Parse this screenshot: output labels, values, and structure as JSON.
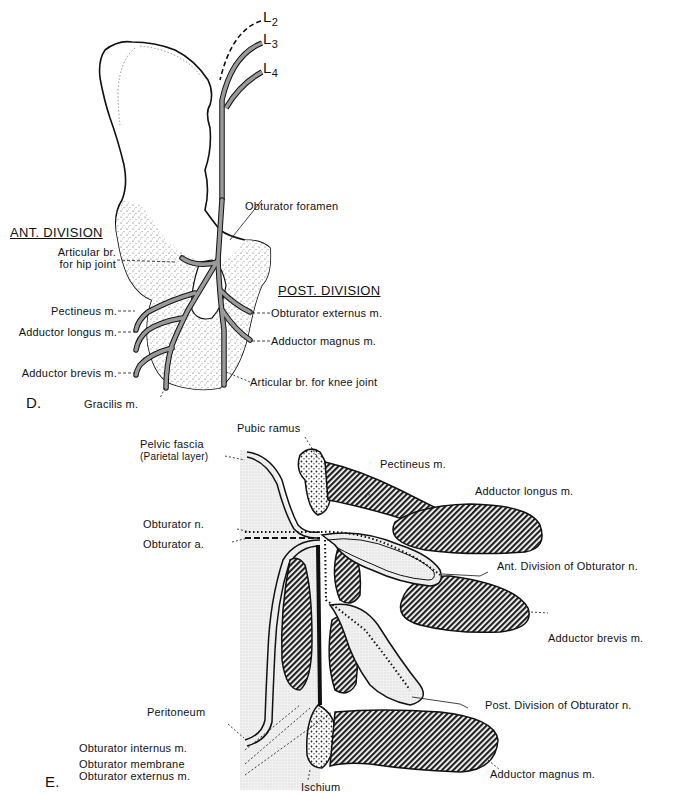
{
  "figure_d": {
    "panel_label": "D.",
    "roots": [
      "L2",
      "L3",
      "L4"
    ],
    "roots_display": {
      "l2": "L",
      "l2_sub": "2",
      "l3": "L",
      "l3_sub": "3",
      "l4": "L",
      "l4_sub": "4"
    },
    "obturator_foramen": "Obturator foramen",
    "ant_division": {
      "heading": "ANT. DIVISION",
      "branches": [
        {
          "line1": "Articular br.",
          "line2": "for hip joint"
        },
        {
          "label": "Pectineus m."
        },
        {
          "label": "Adductor longus m."
        },
        {
          "label": "Adductor brevis m."
        },
        {
          "label": "Gracilis m."
        }
      ]
    },
    "post_division": {
      "heading": "POST. DIVISION",
      "branches": [
        {
          "label": "Obturator externus m."
        },
        {
          "label": "Adductor magnus m."
        },
        {
          "label": "Articular br. for knee joint"
        }
      ]
    }
  },
  "figure_e": {
    "panel_label": "E.",
    "labels": {
      "pubic_ramus": "Pubic ramus",
      "pelvic_fascia_1": "Pelvic fascia",
      "pelvic_fascia_2": "(Parietal layer)",
      "pectineus": "Pectineus m.",
      "adductor_longus": "Adductor longus m.",
      "obturator_n": "Obturator n.",
      "obturator_a": "Obturator a.",
      "ant_division": "Ant. Division of Obturator n.",
      "adductor_brevis": "Adductor brevis m.",
      "peritoneum": "Peritoneum",
      "post_division": "Post. Division of Obturator n.",
      "obturator_internus": "Obturator internus m.",
      "obturator_membrane": "Obturator membrane",
      "obturator_externus": "Obturator externus m.",
      "ischium": "Ischium",
      "adductor_magnus": "Adductor magnus m."
    }
  },
  "colors": {
    "ink": "#111111",
    "nerve_fill": "#9a9a9a",
    "stipple": "#cfcfcf",
    "muscle_hatch": "#222222",
    "background": "#ffffff"
  }
}
